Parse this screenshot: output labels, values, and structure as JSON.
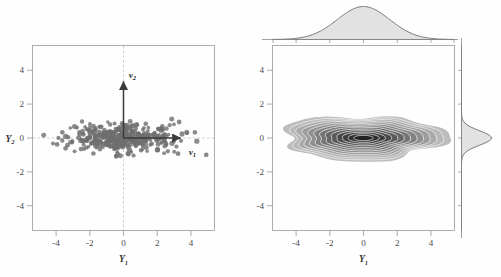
{
  "figure": {
    "title": "",
    "background": "#fefefe",
    "panels": 2
  },
  "left_panel": {
    "name": "scatter-plot-with-principal-axes",
    "xlabel": "Y",
    "xlabel_sub": "1",
    "ylabel": "Y",
    "ylabel_sub": "2",
    "xticks": [
      "-4",
      "-2",
      "0",
      "2",
      "4"
    ],
    "yticks": [
      "4",
      "2",
      "0",
      "-2",
      "-4"
    ],
    "vectors": [
      {
        "label": "v",
        "sub": "1",
        "dx": 3.5,
        "dy": 0.0,
        "label_x": 3.9,
        "label_y": -0.62
      },
      {
        "label": "v",
        "sub": "2",
        "dx": 0.0,
        "dy": 3.5,
        "label_x": 0.35,
        "label_y": 3.55
      }
    ],
    "point_color": "#6e6e6e",
    "frame_color": "#9a9a9a"
  },
  "right_panel": {
    "name": "contour-density-plot-with-marginals",
    "xlabel": "Y",
    "xlabel_sub": "1",
    "ylabel": "Y",
    "ylabel_sub": "2",
    "xticks": [
      "-4",
      "-2",
      "0",
      "2",
      "4"
    ],
    "yticks": [
      "4",
      "2",
      "0",
      "-2",
      "-4"
    ],
    "top_marginal": "density-of-Y1",
    "right_marginal": "density-of-Y2",
    "contour_levels": 12,
    "contour_color_low": "#b8b8b8",
    "contour_color_high": "#2b2b2b"
  },
  "chart_data": [
    {
      "type": "scatter",
      "title": "",
      "xlabel": "Y1",
      "ylabel": "Y2",
      "xlim": [
        -5.4,
        5.4
      ],
      "ylim": [
        -5.4,
        5.4
      ],
      "xticks": [
        -4,
        -2,
        0,
        2,
        4
      ],
      "yticks": [
        -4,
        -2,
        0,
        2,
        4
      ],
      "grid": false,
      "n_points": 420,
      "distribution": "bivariate-normal",
      "mean": [
        0,
        0
      ],
      "std": [
        1.55,
        0.42
      ],
      "correlation": 0.0,
      "annotations": [
        {
          "text": "v1",
          "type": "eigenvector-arrow",
          "from": [
            0,
            0
          ],
          "to": [
            3.5,
            0
          ]
        },
        {
          "text": "v2",
          "type": "eigenvector-arrow",
          "from": [
            0,
            0
          ],
          "to": [
            0,
            3.5
          ]
        }
      ],
      "reference_lines": [
        {
          "orientation": "horizontal",
          "value": 0,
          "style": "dashed"
        },
        {
          "orientation": "vertical",
          "value": 0,
          "style": "dashed"
        }
      ]
    },
    {
      "type": "heatmap",
      "subtype": "contour-density",
      "title": "",
      "xlabel": "Y1",
      "ylabel": "Y2",
      "xlim": [
        -5.4,
        5.4
      ],
      "ylim": [
        -5.4,
        5.4
      ],
      "xticks": [
        -4,
        -2,
        0,
        2,
        4
      ],
      "yticks": [
        -4,
        -2,
        0,
        2,
        4
      ],
      "grid": false,
      "mean": [
        0,
        0
      ],
      "std": [
        1.55,
        0.42
      ],
      "n_levels": 12,
      "marginals": {
        "top": {
          "variable": "Y1",
          "mean": 0,
          "std": 1.55,
          "peak_x": 0
        },
        "right": {
          "variable": "Y2",
          "mean": 0,
          "std": 0.42,
          "peak_y": 0
        }
      }
    }
  ]
}
